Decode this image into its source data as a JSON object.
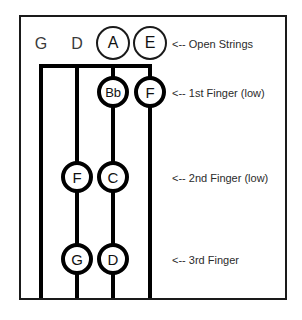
{
  "diagram": {
    "strings": [
      {
        "name": "G",
        "open_label": "G"
      },
      {
        "name": "D",
        "open_label": "D"
      },
      {
        "name": "A",
        "open_label": "A"
      },
      {
        "name": "E",
        "open_label": "E"
      }
    ],
    "open_string_notes": [
      {
        "label": "A",
        "string": "A",
        "style": "circled"
      },
      {
        "label": "E",
        "string": "E",
        "style": "circled"
      }
    ],
    "rows": [
      {
        "annotation": "<-- Open Strings",
        "notes": [
          "G",
          "D",
          "A",
          "E"
        ]
      },
      {
        "annotation": "<-- 1st Finger (low)",
        "notes": [
          "Bb",
          "F"
        ]
      },
      {
        "annotation": "<-- 2nd Finger (low)",
        "notes": [
          "F",
          "C"
        ]
      },
      {
        "annotation": "<-- 3rd Finger",
        "notes": [
          "G",
          "D"
        ]
      }
    ],
    "notes": {
      "open_a": "A",
      "open_e": "E",
      "first_bb": "Bb",
      "first_f": "F",
      "second_f": "F",
      "second_c": "C",
      "third_g": "G",
      "third_d": "D"
    },
    "annotations": {
      "open_strings": "<-- Open Strings",
      "first_finger": "<-- 1st Finger (low)",
      "second_finger": "<-- 2nd Finger (low)",
      "third_finger": "<-- 3rd Finger"
    },
    "colors": {
      "ink": "#000000",
      "frame": "#1a1a1a",
      "text": "#2b2b2b",
      "background": "#ffffff"
    }
  }
}
